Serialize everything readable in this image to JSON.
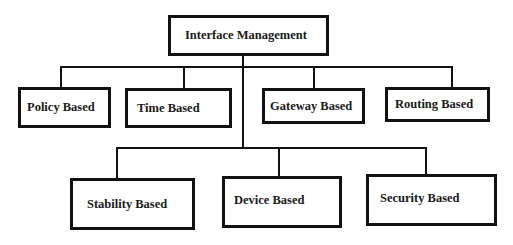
{
  "diagram": {
    "type": "hierarchy",
    "root": {
      "label": "Interface Management"
    },
    "level1": [
      {
        "label": "Policy Based"
      },
      {
        "label": "Time Based"
      },
      {
        "label": "Gateway Based"
      },
      {
        "label": "Routing Based"
      }
    ],
    "level2": [
      {
        "label": "Stability Based"
      },
      {
        "label": "Device Based"
      },
      {
        "label": "Security Based"
      }
    ],
    "colors": {
      "line": "#111111",
      "background": "#ffffff",
      "text": "#1a1a1a"
    }
  }
}
